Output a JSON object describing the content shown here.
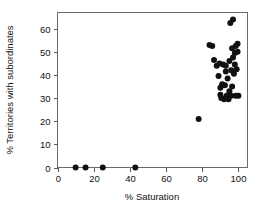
{
  "chart_data": {
    "type": "scatter",
    "title": "",
    "xlabel": "% Saturation",
    "ylabel": "% Territories with subordinates",
    "xlim": [
      0,
      105
    ],
    "ylim": [
      0,
      67
    ],
    "xticks": [
      0,
      20,
      40,
      60,
      80,
      100
    ],
    "yticks": [
      0,
      10,
      20,
      30,
      40,
      50,
      60
    ],
    "xtick_labels": [
      "0",
      "20",
      "40",
      "60",
      "80",
      "100"
    ],
    "ytick_labels": [
      "0",
      "10",
      "20",
      "30",
      "40",
      "50",
      "60"
    ],
    "grid": false,
    "legend": null,
    "marker": "filled-circle",
    "marker_color": "#111111",
    "marker_size": 3.0,
    "frame": true,
    "points": [
      {
        "x": 10.0,
        "y": 0.0
      },
      {
        "x": 15.5,
        "y": 0.0
      },
      {
        "x": 25.0,
        "y": 0.0
      },
      {
        "x": 43.0,
        "y": 0.0
      },
      {
        "x": 78.0,
        "y": 21.0
      },
      {
        "x": 84.0,
        "y": 53.0
      },
      {
        "x": 85.5,
        "y": 52.5
      },
      {
        "x": 86.5,
        "y": 46.5
      },
      {
        "x": 88.0,
        "y": 44.0
      },
      {
        "x": 89.0,
        "y": 39.5
      },
      {
        "x": 89.5,
        "y": 45.0
      },
      {
        "x": 90.0,
        "y": 34.5
      },
      {
        "x": 90.0,
        "y": 31.5
      },
      {
        "x": 90.5,
        "y": 30.0
      },
      {
        "x": 91.0,
        "y": 36.0
      },
      {
        "x": 91.5,
        "y": 44.5
      },
      {
        "x": 92.0,
        "y": 29.5
      },
      {
        "x": 92.5,
        "y": 35.5
      },
      {
        "x": 93.0,
        "y": 41.5
      },
      {
        "x": 93.0,
        "y": 44.0
      },
      {
        "x": 93.5,
        "y": 31.0
      },
      {
        "x": 94.0,
        "y": 38.5
      },
      {
        "x": 94.0,
        "y": 30.0
      },
      {
        "x": 94.5,
        "y": 29.5
      },
      {
        "x": 95.0,
        "y": 46.0
      },
      {
        "x": 95.0,
        "y": 33.0
      },
      {
        "x": 95.5,
        "y": 62.5
      },
      {
        "x": 96.0,
        "y": 42.0
      },
      {
        "x": 96.0,
        "y": 31.0
      },
      {
        "x": 96.5,
        "y": 51.5
      },
      {
        "x": 96.5,
        "y": 35.0
      },
      {
        "x": 97.0,
        "y": 64.0
      },
      {
        "x": 97.0,
        "y": 47.5
      },
      {
        "x": 97.5,
        "y": 40.5
      },
      {
        "x": 98.0,
        "y": 49.5
      },
      {
        "x": 98.0,
        "y": 44.5
      },
      {
        "x": 98.5,
        "y": 52.5
      },
      {
        "x": 98.5,
        "y": 31.0
      },
      {
        "x": 99.0,
        "y": 42.5
      },
      {
        "x": 99.5,
        "y": 53.5
      },
      {
        "x": 99.5,
        "y": 50.0
      },
      {
        "x": 100.0,
        "y": 31.0
      }
    ]
  },
  "axis": {
    "x_title": "% Saturation",
    "y_title": "% Territories with subordinates"
  }
}
